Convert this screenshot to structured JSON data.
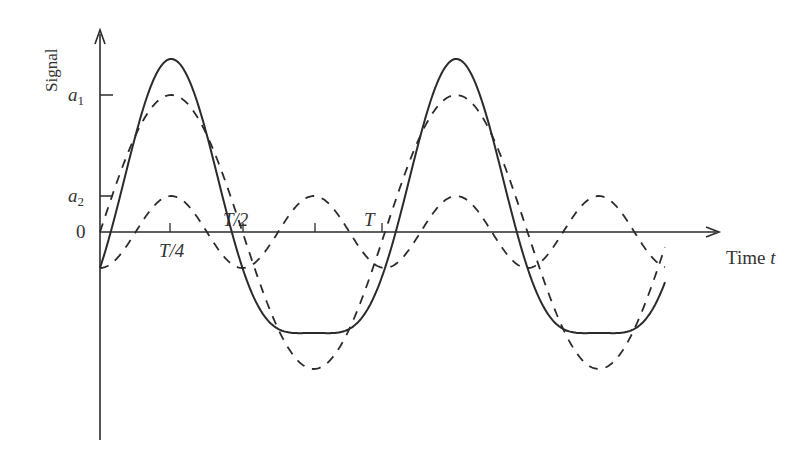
{
  "figure": {
    "y_axis_label": "Signal",
    "x_axis_label": "Time ",
    "x_axis_var": "t",
    "y_ticks": [
      {
        "label": "a",
        "sub": "1",
        "y": 95
      },
      {
        "label": "a",
        "sub": "2",
        "y": 196
      },
      {
        "label": "0",
        "sub": "",
        "y": 232
      }
    ],
    "x_ticks": [
      {
        "label": "T/4",
        "x": 170
      },
      {
        "label": "T/2",
        "x": 243
      },
      {
        "label": "",
        "x": 315
      },
      {
        "label": "T",
        "x": 382
      }
    ],
    "colors": {
      "line": "#2b2b2b",
      "text": "#333333"
    }
  },
  "chart_data": {
    "type": "line",
    "title": "",
    "xlabel": "Time t",
    "ylabel": "Signal",
    "x_range_periods": [
      0,
      2
    ],
    "series": [
      {
        "name": "fundamental (dashed)",
        "style": "dashed",
        "amplitude": "a1",
        "harmonic": 1
      },
      {
        "name": "harmonic (dashed)",
        "style": "dashed",
        "amplitude": "a2",
        "harmonic": 2
      },
      {
        "name": "sum (solid)",
        "style": "solid",
        "components": [
          "fundamental",
          "harmonic"
        ]
      }
    ],
    "pixel_model": {
      "x0": 100,
      "y0": 232,
      "period_px": 285,
      "a1_px": 137,
      "a2_px": 36,
      "x_end": 665
    }
  }
}
